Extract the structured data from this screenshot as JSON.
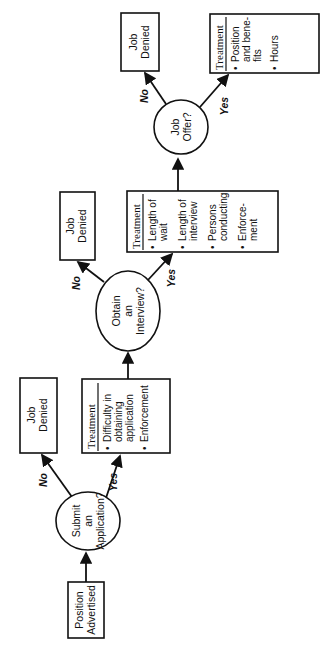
{
  "diagram": {
    "orientation": "rotated -90deg (flow reads bottom to top)",
    "colors": {
      "line": "#111111",
      "background": "#ffffff"
    },
    "nodes": {
      "position_advertised": {
        "lines": [
          "Position",
          "Advertised"
        ]
      },
      "submit_application": {
        "lines": [
          "Submit",
          "an",
          "Application?"
        ]
      },
      "job_denied_1": {
        "lines": [
          "Job",
          "Denied"
        ]
      },
      "treatment_1": {
        "title": "Treatment",
        "bullets": [
          [
            "Difficulty in",
            "obtaining",
            "application"
          ],
          [
            "Enforcement"
          ]
        ]
      },
      "obtain_interview": {
        "lines": [
          "Obtain",
          "an",
          "Interview?"
        ]
      },
      "job_denied_2": {
        "lines": [
          "Job",
          "Denied"
        ]
      },
      "treatment_2": {
        "title": "Treatment",
        "bullets": [
          [
            "Length of",
            "wait"
          ],
          [
            "Length of",
            "interview"
          ],
          [
            "Persons",
            "conducting"
          ],
          [
            "Enforce-",
            "ment"
          ]
        ]
      },
      "job_offer": {
        "lines": [
          "Job",
          "Offer?"
        ]
      },
      "job_denied_3": {
        "lines": [
          "Job",
          "Denied"
        ]
      },
      "treatment_3": {
        "title": "Treatment",
        "bullets": [
          [
            "Position",
            "and bene-",
            "fits"
          ],
          [
            "Hours"
          ]
        ]
      }
    },
    "edge_labels": {
      "no": "No",
      "yes": "Yes"
    },
    "bullet": "•"
  }
}
